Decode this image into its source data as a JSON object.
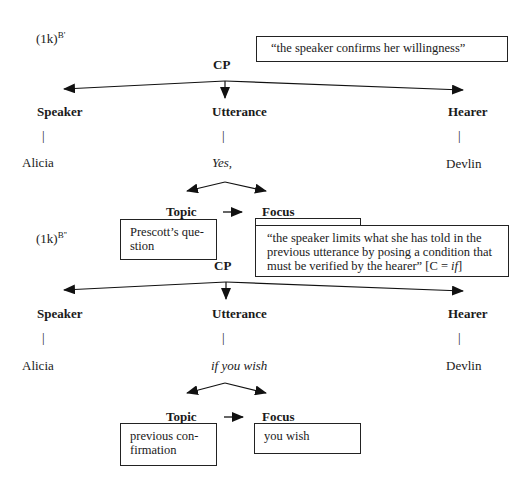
{
  "block1": {
    "label": "(1k)",
    "label_sup": "B'",
    "root": "CP",
    "annotation": "“the speaker confirms her willingness”",
    "speaker": {
      "header": "Speaker",
      "pipe": "|",
      "value": "Alicia"
    },
    "utterance": {
      "header": "Utterance",
      "pipe": "|",
      "value": "Yes,"
    },
    "hearer": {
      "header": "Hearer",
      "pipe": "|",
      "value": "Devlin"
    },
    "topic": {
      "header": "Topic",
      "content": "Prescott’s question"
    },
    "focus": {
      "header": "Focus",
      "content": ""
    }
  },
  "block2": {
    "label": "(1k)",
    "label_sup": "B''",
    "root": "CP",
    "annotation": "“the speaker limits what she has told in the previous utterance by posing a condition that must be verified by the hearer” [C = if]",
    "annotation_main": "“the speaker limits what she has told in the previous utterance by posing a condition that must be verified by the hearer” [C = ",
    "annotation_italic": "if",
    "annotation_end": "]",
    "speaker": {
      "header": "Speaker",
      "pipe": "|",
      "value": "Alicia"
    },
    "utterance": {
      "header": "Utterance",
      "pipe": "|",
      "value": "if you wish"
    },
    "hearer": {
      "header": "Hearer",
      "pipe": "|",
      "value": "Devlin"
    },
    "topic": {
      "header": "Topic",
      "content": "previous confirmation",
      "line1": "previous con-",
      "line2": "firmation"
    },
    "focus": {
      "header": "Focus",
      "content": "you wish"
    }
  },
  "topic1_lines": {
    "line1": "Prescott’s que-",
    "line2": "stion"
  },
  "colors": {
    "ink": "#1a1a1a",
    "background": "#ffffff"
  }
}
